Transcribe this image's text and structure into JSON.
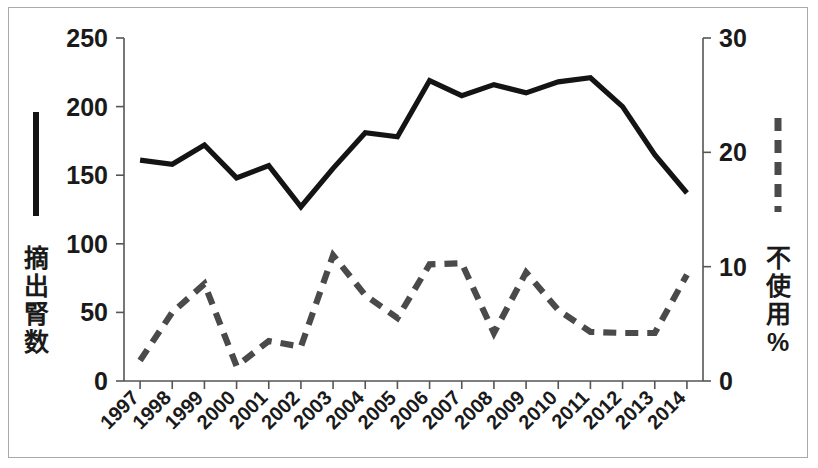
{
  "chart_data": {
    "type": "line",
    "title": "",
    "xlabel": "",
    "grid": false,
    "legend_position": "outside-left-and-right",
    "categories": [
      "1997",
      "1998",
      "1999",
      "2000",
      "2001",
      "2002",
      "2003",
      "2004",
      "2005",
      "2006",
      "2007",
      "2008",
      "2009",
      "2010",
      "2011",
      "2012",
      "2013",
      "2014"
    ],
    "axes": {
      "left": {
        "label": "摘出腎数",
        "ylim": [
          0,
          250
        ],
        "ticks": [
          0,
          50,
          100,
          150,
          200,
          250
        ],
        "tick_labels": [
          "0",
          "50",
          "100",
          "150",
          "200",
          "250"
        ]
      },
      "right": {
        "label": "不使用%",
        "ylim": [
          0,
          30
        ],
        "ticks": [
          0,
          10,
          20,
          30
        ],
        "tick_labels": [
          "0",
          "10",
          "20",
          "30"
        ]
      }
    },
    "series": [
      {
        "name": "摘出腎数",
        "axis": "left",
        "style": "solid",
        "color": "#141414",
        "values": [
          161,
          158,
          172,
          148,
          157,
          127,
          155,
          181,
          178,
          219,
          208,
          216,
          210,
          218,
          221,
          200,
          165,
          137
        ]
      },
      {
        "name": "不使用%",
        "axis": "right",
        "style": "dashed",
        "color": "#4a4a4a",
        "values": [
          1.8,
          6.0,
          8.5,
          1.3,
          3.5,
          3.0,
          11.0,
          7.5,
          5.5,
          10.2,
          10.3,
          4.2,
          9.5,
          6.2,
          4.3,
          4.2,
          4.2,
          9.3
        ]
      }
    ]
  },
  "legend": {
    "left_marker": "solid-line-swatch",
    "right_marker": "dashed-line-swatch"
  }
}
